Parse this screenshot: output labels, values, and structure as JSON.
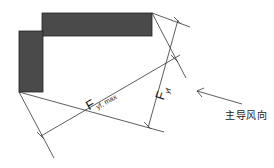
{
  "diagram": {
    "buildings": [
      {
        "name": "top-bar",
        "x": 42,
        "y": 13,
        "w": 110,
        "h": 23,
        "fill": "#4a4a4a"
      },
      {
        "name": "left-bar",
        "x": 19,
        "y": 31,
        "w": 24,
        "h": 61,
        "fill": "#4a4a4a"
      }
    ],
    "labels": {
      "f_max_main": "F",
      "f_max_sub": "yf, max",
      "f_yf_main": "F",
      "f_yf_sub": "yf",
      "wind_direction": "主导风向"
    },
    "colors": {
      "line": "#333333",
      "building": "#4a4a4a",
      "background": "#ffffff"
    }
  }
}
